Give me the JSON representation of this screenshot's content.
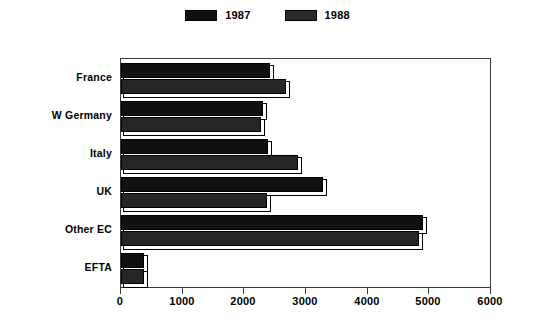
{
  "chart_data": {
    "type": "bar",
    "orientation": "horizontal",
    "title": "",
    "subtitle": "",
    "xlabel": "",
    "ylabel": "",
    "categories": [
      "France",
      "W Germany",
      "Italy",
      "UK",
      "Other EC",
      "EFTA"
    ],
    "series": [
      {
        "name": "1987",
        "values": [
          2420,
          2300,
          2390,
          3270,
          4900,
          380
        ],
        "color": "#111111",
        "pattern": "solid"
      },
      {
        "name": "1988",
        "values": [
          2680,
          2270,
          2870,
          2370,
          4830,
          370
        ],
        "color": "#b5b5b5",
        "pattern": "cross-hatch"
      }
    ],
    "xlim": [
      0,
      6000
    ],
    "xticks": [
      0,
      1000,
      2000,
      3000,
      4000,
      5000,
      6000
    ],
    "xtick_labels": [
      "0",
      "1000",
      "2000",
      "3000",
      "4000",
      "5000",
      "6000"
    ],
    "grid": false,
    "legend": {
      "position": "top-center",
      "entries": [
        "1987",
        "1988"
      ]
    }
  },
  "legend": {
    "entries": [
      {
        "label": "1987",
        "swatch": "solid-black-swatch"
      },
      {
        "label": "1988",
        "swatch": "hatched-gray-swatch"
      }
    ]
  },
  "axis": {
    "x_tick_labels": [
      "0",
      "1000",
      "2000",
      "3000",
      "4000",
      "5000",
      "6000"
    ]
  },
  "categories": [
    "France",
    "W Germany",
    "Italy",
    "UK",
    "Other EC",
    "EFTA"
  ],
  "colors": {
    "series_1987": "#111111",
    "series_1988": "#b5b5b5",
    "axis": "#3a3a3a",
    "background": "#ffffff"
  }
}
